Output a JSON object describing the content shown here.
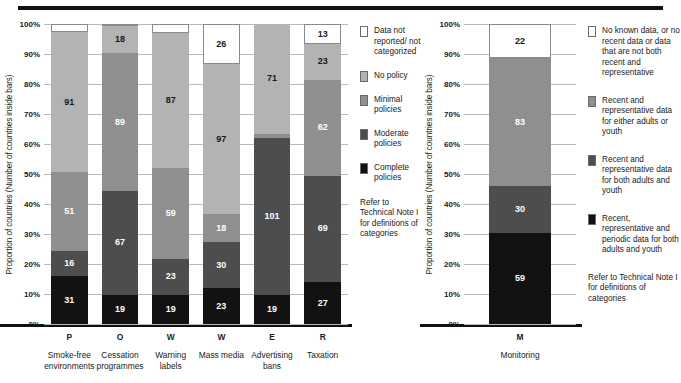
{
  "axis": {
    "ylabel": "Proportion of countries (Number of countries inside bars)",
    "yticks": [
      "100%",
      "90%",
      "80%",
      "70%",
      "60%",
      "50%",
      "40%",
      "30%",
      "20%",
      "10%",
      "0%"
    ]
  },
  "colors": {
    "not_reported": "#ffffff",
    "no_policy": "#b3b3b3",
    "minimal": "#8f8f8f",
    "moderate": "#4d4d4d",
    "complete": "#121212",
    "gridline": "#b9b9b9",
    "rule": "#111111"
  },
  "left_legend": {
    "items": [
      {
        "label": "Data not reported/ not categorized",
        "color": "#ffffff"
      },
      {
        "label": "No policy",
        "color": "#b3b3b3"
      },
      {
        "label": "Minimal policies",
        "color": "#8f8f8f"
      },
      {
        "label": "Moderate policies",
        "color": "#4d4d4d"
      },
      {
        "label": "Complete policies",
        "color": "#121212"
      }
    ],
    "note": "Refer to Technical Note I for definitions of categories"
  },
  "right_legend": {
    "items": [
      {
        "label": "No known data, or no recent data or data that are not both recent and representative",
        "color": "#ffffff"
      },
      {
        "label": "Recent and representative data for either adults or youth",
        "color": "#8f8f8f"
      },
      {
        "label": "Recent and representative data for both adults and youth",
        "color": "#4d4d4d"
      },
      {
        "label": "Recent, representative and periodic data for both adults and youth",
        "color": "#121212"
      }
    ],
    "note": "Refer to Technical Note I for definitions of categories"
  },
  "chart_data": [
    {
      "type": "bar",
      "id": "mpower-policies",
      "title": "",
      "xlabel": "",
      "ylabel": "Proportion of countries (Number of countries inside bars)",
      "ylim": [
        0,
        100
      ],
      "grid": true,
      "stacked": true,
      "percent": true,
      "total_countries": 194,
      "categories": [
        "P",
        "O",
        "W",
        "W",
        "E",
        "R"
      ],
      "category_names": [
        "Smoke-free environments",
        "Cessation programmes",
        "Warning labels",
        "Mass media",
        "Advertising bans",
        "Taxation"
      ],
      "series": [
        {
          "name": "Complete policies",
          "color": "#121212",
          "values": [
            31,
            19,
            19,
            23,
            19,
            27
          ]
        },
        {
          "name": "Moderate policies",
          "color": "#4d4d4d",
          "values": [
            16,
            67,
            23,
            30,
            101,
            69
          ]
        },
        {
          "name": "Minimal policies",
          "color": "#8f8f8f",
          "values": [
            51,
            89,
            59,
            18,
            3,
            62
          ]
        },
        {
          "name": "No policy",
          "color": "#b3b3b3",
          "values": [
            91,
            18,
            87,
            97,
            71,
            23
          ]
        },
        {
          "name": "Data not reported/not categorized",
          "color": "#ffffff",
          "values": [
            5,
            1,
            6,
            26,
            0,
            13
          ]
        }
      ]
    },
    {
      "type": "bar",
      "id": "monitoring",
      "title": "",
      "xlabel": "",
      "ylabel": "Proportion of countries (Number of countries inside bars)",
      "ylim": [
        0,
        100
      ],
      "grid": true,
      "stacked": true,
      "percent": true,
      "total_countries": 194,
      "categories": [
        "M"
      ],
      "category_names": [
        "Monitoring"
      ],
      "series": [
        {
          "name": "Recent, representative and periodic data for both adults and youth",
          "color": "#121212",
          "values": [
            59
          ]
        },
        {
          "name": "Recent and representative data for both adults and youth",
          "color": "#4d4d4d",
          "values": [
            30
          ]
        },
        {
          "name": "Recent and representative data for either adults or youth",
          "color": "#8f8f8f",
          "values": [
            83
          ]
        },
        {
          "name": "No known data, or no recent data or data that are not both recent and representative",
          "color": "#ffffff",
          "values": [
            22
          ]
        }
      ]
    }
  ]
}
